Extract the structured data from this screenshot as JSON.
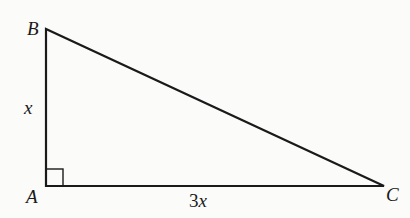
{
  "figure": {
    "type": "right-triangle",
    "vertices": {
      "B": {
        "label": "B",
        "x": 46,
        "y": 29
      },
      "A": {
        "label": "A",
        "x": 46,
        "y": 186
      },
      "C": {
        "label": "C",
        "x": 384,
        "y": 186
      }
    },
    "right_angle_at": "A",
    "sides": {
      "AB": {
        "label": "x"
      },
      "AC": {
        "label_coef": "3",
        "label_var": "x"
      }
    },
    "colors": {
      "stroke": "#1a1a1a",
      "background": "#fbfbfa"
    }
  }
}
